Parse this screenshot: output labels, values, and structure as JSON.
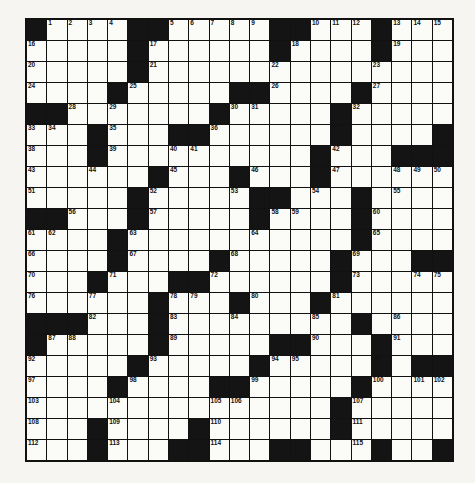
{
  "puzzle": {
    "rows": 21,
    "cols": 21,
    "grid": [
      "#....##.....##...#...",
      ".....#......#....#...",
      ".....#...............",
      "....#.....##....#....",
      "##.......#.....#.....",
      "...#...##......#....#",
      "...#..........#...###",
      "......#...#...#......",
      ".....#.....##...#....",
      "##...#.....#....#....",
      "....#...........#....",
      "....#....#.....#...##",
      "...#...##......#.....",
      "......#...#...#......",
      "###...#.........#....",
      "#.....#.....##...#...",
      ".....#.....#.....#.##",
      "....#....##.....#....",
      "...............#.....",
      "...#....#......#.....",
      "...#...##...##...#..#"
    ],
    "numbers": [
      {
        "r": 0,
        "c": 1,
        "n": 1
      },
      {
        "r": 0,
        "c": 2,
        "n": 2
      },
      {
        "r": 0,
        "c": 3,
        "n": 3
      },
      {
        "r": 0,
        "c": 4,
        "n": 4
      },
      {
        "r": 0,
        "c": 7,
        "n": 5
      },
      {
        "r": 0,
        "c": 8,
        "n": 6
      },
      {
        "r": 0,
        "c": 9,
        "n": 7
      },
      {
        "r": 0,
        "c": 10,
        "n": 8
      },
      {
        "r": 0,
        "c": 11,
        "n": 9
      },
      {
        "r": 0,
        "c": 14,
        "n": 10
      },
      {
        "r": 0,
        "c": 15,
        "n": 11
      },
      {
        "r": 0,
        "c": 16,
        "n": 12
      },
      {
        "r": 0,
        "c": 18,
        "n": 13
      },
      {
        "r": 0,
        "c": 19,
        "n": 14
      },
      {
        "r": 0,
        "c": 20,
        "n": 15
      },
      {
        "r": 1,
        "c": 0,
        "n": 16
      },
      {
        "r": 1,
        "c": 6,
        "n": 17
      },
      {
        "r": 1,
        "c": 13,
        "n": 18
      },
      {
        "r": 1,
        "c": 18,
        "n": 19
      },
      {
        "r": 2,
        "c": 0,
        "n": 20
      },
      {
        "r": 2,
        "c": 6,
        "n": 21
      },
      {
        "r": 2,
        "c": 12,
        "n": 22
      },
      {
        "r": 2,
        "c": 17,
        "n": 23
      },
      {
        "r": 3,
        "c": 0,
        "n": 24
      },
      {
        "r": 3,
        "c": 5,
        "n": 25
      },
      {
        "r": 3,
        "c": 12,
        "n": 26
      },
      {
        "r": 3,
        "c": 17,
        "n": 27
      },
      {
        "r": 4,
        "c": 2,
        "n": 28
      },
      {
        "r": 4,
        "c": 4,
        "n": 29
      },
      {
        "r": 4,
        "c": 10,
        "n": 30
      },
      {
        "r": 4,
        "c": 11,
        "n": 31
      },
      {
        "r": 4,
        "c": 16,
        "n": 32
      },
      {
        "r": 5,
        "c": 0,
        "n": 33
      },
      {
        "r": 5,
        "c": 1,
        "n": 34
      },
      {
        "r": 5,
        "c": 4,
        "n": 35
      },
      {
        "r": 5,
        "c": 9,
        "n": 36
      },
      {
        "r": 5,
        "c": 15,
        "n": 37
      },
      {
        "r": 6,
        "c": 0,
        "n": 38
      },
      {
        "r": 6,
        "c": 4,
        "n": 39
      },
      {
        "r": 6,
        "c": 7,
        "n": 40
      },
      {
        "r": 6,
        "c": 8,
        "n": 41
      },
      {
        "r": 6,
        "c": 15,
        "n": 42
      },
      {
        "r": 7,
        "c": 0,
        "n": 43
      },
      {
        "r": 7,
        "c": 3,
        "n": 44
      },
      {
        "r": 7,
        "c": 7,
        "n": 45
      },
      {
        "r": 7,
        "c": 11,
        "n": 46
      },
      {
        "r": 7,
        "c": 15,
        "n": 47
      },
      {
        "r": 7,
        "c": 18,
        "n": 48
      },
      {
        "r": 7,
        "c": 19,
        "n": 49
      },
      {
        "r": 7,
        "c": 20,
        "n": 50
      },
      {
        "r": 8,
        "c": 0,
        "n": 51
      },
      {
        "r": 8,
        "c": 6,
        "n": 52
      },
      {
        "r": 8,
        "c": 10,
        "n": 53
      },
      {
        "r": 8,
        "c": 14,
        "n": 54
      },
      {
        "r": 8,
        "c": 18,
        "n": 55
      },
      {
        "r": 9,
        "c": 2,
        "n": 56
      },
      {
        "r": 9,
        "c": 6,
        "n": 57
      },
      {
        "r": 9,
        "c": 12,
        "n": 58
      },
      {
        "r": 9,
        "c": 13,
        "n": 59
      },
      {
        "r": 9,
        "c": 17,
        "n": 60
      },
      {
        "r": 10,
        "c": 0,
        "n": 61
      },
      {
        "r": 10,
        "c": 1,
        "n": 62
      },
      {
        "r": 10,
        "c": 5,
        "n": 63
      },
      {
        "r": 10,
        "c": 11,
        "n": 64
      },
      {
        "r": 10,
        "c": 17,
        "n": 65
      },
      {
        "r": 11,
        "c": 0,
        "n": 66
      },
      {
        "r": 11,
        "c": 5,
        "n": 67
      },
      {
        "r": 11,
        "c": 10,
        "n": 68
      },
      {
        "r": 11,
        "c": 16,
        "n": 69
      },
      {
        "r": 12,
        "c": 0,
        "n": 70
      },
      {
        "r": 12,
        "c": 4,
        "n": 71
      },
      {
        "r": 12,
        "c": 9,
        "n": 72
      },
      {
        "r": 12,
        "c": 16,
        "n": 73
      },
      {
        "r": 12,
        "c": 19,
        "n": 74
      },
      {
        "r": 12,
        "c": 20,
        "n": 75
      },
      {
        "r": 13,
        "c": 0,
        "n": 76
      },
      {
        "r": 13,
        "c": 3,
        "n": 77
      },
      {
        "r": 13,
        "c": 7,
        "n": 78
      },
      {
        "r": 13,
        "c": 8,
        "n": 79
      },
      {
        "r": 13,
        "c": 11,
        "n": 80
      },
      {
        "r": 13,
        "c": 15,
        "n": 81
      },
      {
        "r": 14,
        "c": 3,
        "n": 82
      },
      {
        "r": 14,
        "c": 7,
        "n": 83
      },
      {
        "r": 14,
        "c": 10,
        "n": 84
      },
      {
        "r": 14,
        "c": 14,
        "n": 85
      },
      {
        "r": 14,
        "c": 18,
        "n": 86
      },
      {
        "r": 15,
        "c": 1,
        "n": 87
      },
      {
        "r": 15,
        "c": 2,
        "n": 88
      },
      {
        "r": 15,
        "c": 7,
        "n": 89
      },
      {
        "r": 15,
        "c": 14,
        "n": 90
      },
      {
        "r": 15,
        "c": 18,
        "n": 91
      },
      {
        "r": 16,
        "c": 0,
        "n": 92
      },
      {
        "r": 16,
        "c": 6,
        "n": 93
      },
      {
        "r": 16,
        "c": 12,
        "n": 94
      },
      {
        "r": 16,
        "c": 13,
        "n": 95
      },
      {
        "r": 16,
        "c": 17,
        "n": 96
      },
      {
        "r": 17,
        "c": 0,
        "n": 97
      },
      {
        "r": 17,
        "c": 5,
        "n": 98
      },
      {
        "r": 17,
        "c": 11,
        "n": 99
      },
      {
        "r": 17,
        "c": 17,
        "n": 100
      },
      {
        "r": 17,
        "c": 19,
        "n": 101
      },
      {
        "r": 17,
        "c": 20,
        "n": 102
      },
      {
        "r": 18,
        "c": 0,
        "n": 103
      },
      {
        "r": 18,
        "c": 4,
        "n": 104
      },
      {
        "r": 18,
        "c": 9,
        "n": 105
      },
      {
        "r": 18,
        "c": 10,
        "n": 106
      },
      {
        "r": 18,
        "c": 16,
        "n": 107
      },
      {
        "r": 19,
        "c": 0,
        "n": 108
      },
      {
        "r": 19,
        "c": 4,
        "n": 109
      },
      {
        "r": 19,
        "c": 9,
        "n": 110
      },
      {
        "r": 19,
        "c": 16,
        "n": 111
      },
      {
        "r": 20,
        "c": 0,
        "n": 112
      },
      {
        "r": 20,
        "c": 4,
        "n": 113
      },
      {
        "r": 20,
        "c": 9,
        "n": 114
      },
      {
        "r": 20,
        "c": 16,
        "n": 115
      }
    ]
  },
  "colors": {
    "black": "#141414",
    "white": "#fbfbf8",
    "page": "#f6f5f1"
  }
}
